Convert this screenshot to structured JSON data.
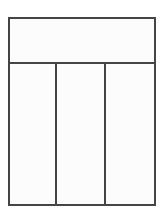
{
  "diagram": {
    "type": "line-drawing",
    "colors": {
      "stroke": "#454545",
      "fill": "#fcfcfc",
      "background": "#ffffff"
    },
    "geometry": {
      "outer": {
        "x": 9,
        "y": 18,
        "width": 146,
        "height": 187
      },
      "header_divider_y": 63,
      "column_divider_x": [
        56,
        105
      ],
      "stroke_width": 2
    },
    "regions": [
      {
        "id": "header-band",
        "label": "",
        "x": 9,
        "y": 18,
        "width": 146,
        "height": 45
      },
      {
        "id": "column-left",
        "label": "",
        "x": 9,
        "y": 63,
        "width": 47,
        "height": 142
      },
      {
        "id": "column-center",
        "label": "",
        "x": 56,
        "y": 63,
        "width": 49,
        "height": 142
      },
      {
        "id": "column-right",
        "label": "",
        "x": 105,
        "y": 63,
        "width": 50,
        "height": 142
      }
    ],
    "counts": {
      "regions_total": 4,
      "columns": 3,
      "header_rows": 1
    }
  }
}
